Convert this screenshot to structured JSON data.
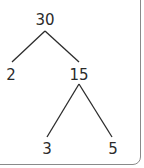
{
  "diagram": {
    "type": "factor-tree",
    "nodes": [
      {
        "id": "root",
        "label": "30",
        "x": 45,
        "y": 25
      },
      {
        "id": "left",
        "label": "2",
        "x": 11,
        "y": 80
      },
      {
        "id": "right",
        "label": "15",
        "x": 79,
        "y": 80
      },
      {
        "id": "right-left",
        "label": "3",
        "x": 47,
        "y": 154
      },
      {
        "id": "right-right",
        "label": "5",
        "x": 113,
        "y": 154
      }
    ],
    "edges": [
      {
        "from": "30",
        "to": "2"
      },
      {
        "from": "30",
        "to": "15"
      },
      {
        "from": "15",
        "to": "3"
      },
      {
        "from": "15",
        "to": "5"
      }
    ],
    "colors": {
      "line": "#2b2b2b",
      "text": "#2b2b2b",
      "border": "#8a8a8a"
    }
  }
}
